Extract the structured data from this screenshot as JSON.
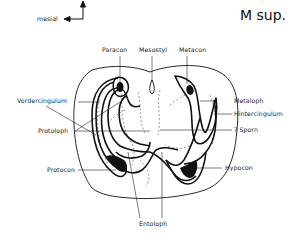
{
  "figure": {
    "title": "M sup.",
    "orientation": {
      "label": "mesial",
      "arrow": "left"
    }
  },
  "labels": {
    "paracon": "Paracon",
    "mesostyl": "Mesostyl",
    "metacon": "Metacon",
    "vordercingulum": "Vordercingulum",
    "protoloph": "Protoloph",
    "metaloph": "Metaloph",
    "hintercingulum": "Hintercingulum",
    "sporn": "? Sporn",
    "protocon": "Protocon",
    "hypocon": "Hypocon",
    "entoloph": "Entoloph"
  },
  "colors": {
    "ink": "#111111",
    "background": "#ffffff"
  }
}
